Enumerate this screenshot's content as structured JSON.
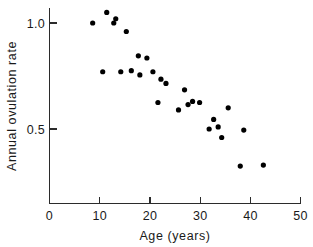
{
  "chart_data": {
    "type": "scatter",
    "title": "",
    "xlabel": "Age (years)",
    "ylabel": "Annual ovulation rate",
    "xlim": [
      0,
      50
    ],
    "ylim": [
      0.15,
      1.12
    ],
    "xticks": [
      0,
      10,
      20,
      30,
      40,
      50
    ],
    "xtick_labels": [
      "0",
      "10",
      "20",
      "30",
      "40",
      "50"
    ],
    "yticks": [
      0.5,
      1.0
    ],
    "ytick_labels": [
      "0.5",
      "1.0"
    ],
    "grid": false,
    "legend": null,
    "marker": "filled-circle",
    "marker_color": "#000000",
    "n_points": 37,
    "points": [
      {
        "x": 8.6,
        "y": 1.0
      },
      {
        "x": 10.6,
        "y": 0.77
      },
      {
        "x": 11.4,
        "y": 1.05
      },
      {
        "x": 12.8,
        "y": 1.0
      },
      {
        "x": 13.2,
        "y": 1.02
      },
      {
        "x": 15.3,
        "y": 0.96
      },
      {
        "x": 14.2,
        "y": 0.77
      },
      {
        "x": 16.3,
        "y": 0.775
      },
      {
        "x": 17.7,
        "y": 0.845
      },
      {
        "x": 18.0,
        "y": 0.755
      },
      {
        "x": 19.4,
        "y": 0.835
      },
      {
        "x": 20.6,
        "y": 0.77
      },
      {
        "x": 21.6,
        "y": 0.625
      },
      {
        "x": 22.2,
        "y": 0.735
      },
      {
        "x": 23.2,
        "y": 0.715
      },
      {
        "x": 25.7,
        "y": 0.59
      },
      {
        "x": 26.9,
        "y": 0.685
      },
      {
        "x": 27.6,
        "y": 0.615
      },
      {
        "x": 28.5,
        "y": 0.63
      },
      {
        "x": 29.9,
        "y": 0.625
      },
      {
        "x": 31.8,
        "y": 0.5
      },
      {
        "x": 32.7,
        "y": 0.545
      },
      {
        "x": 33.6,
        "y": 0.51
      },
      {
        "x": 34.3,
        "y": 0.46
      },
      {
        "x": 35.6,
        "y": 0.6
      },
      {
        "x": 38.0,
        "y": 0.325
      },
      {
        "x": 38.7,
        "y": 0.495
      },
      {
        "x": 42.6,
        "y": 0.33
      }
    ]
  },
  "axes": {
    "x_axis_name": "x-axis",
    "y_axis_name": "y-axis"
  }
}
